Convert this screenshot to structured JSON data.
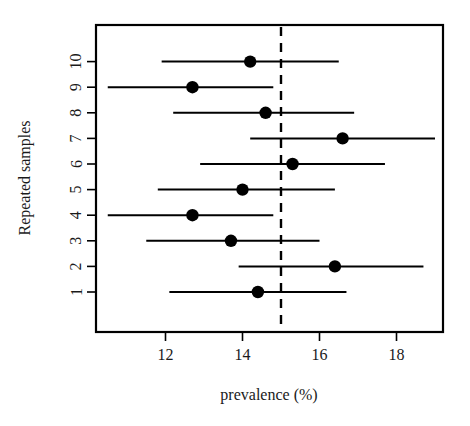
{
  "chart_data": {
    "type": "scatter",
    "title": "",
    "subtitle": "",
    "xlabel": "prevalence (%)",
    "ylabel": "Repeated samples",
    "xlim": [
      10.1,
      19.2
    ],
    "ylim": [
      0.4,
      10.6
    ],
    "grid": false,
    "legend": null,
    "xticks": [
      12,
      14,
      16,
      18
    ],
    "xtick_labels": [
      "12",
      "14",
      "16",
      "18"
    ],
    "yticks": [
      1,
      2,
      3,
      4,
      5,
      6,
      7,
      8,
      9,
      10
    ],
    "ytick_labels": [
      "1",
      "2",
      "3",
      "4",
      "5",
      "6",
      "7",
      "8",
      "9",
      "10"
    ],
    "annotations": [
      {
        "name": "reference-line",
        "type": "vline",
        "x": 15.0,
        "style": "dashed",
        "label": ""
      }
    ],
    "series": [
      {
        "name": "prevalence estimate with 95% confidence interval",
        "marker": "filled-circle",
        "color": "#000000",
        "points": [
          {
            "sample": 1,
            "estimate": 14.4,
            "ci_low": 12.1,
            "ci_high": 16.7
          },
          {
            "sample": 2,
            "estimate": 16.4,
            "ci_low": 13.9,
            "ci_high": 18.7
          },
          {
            "sample": 3,
            "estimate": 13.7,
            "ci_low": 11.5,
            "ci_high": 16.0
          },
          {
            "sample": 4,
            "estimate": 12.7,
            "ci_low": 10.5,
            "ci_high": 14.8
          },
          {
            "sample": 5,
            "estimate": 14.0,
            "ci_low": 11.8,
            "ci_high": 16.4
          },
          {
            "sample": 6,
            "estimate": 15.3,
            "ci_low": 12.9,
            "ci_high": 17.7
          },
          {
            "sample": 7,
            "estimate": 16.6,
            "ci_low": 14.2,
            "ci_high": 19.0
          },
          {
            "sample": 8,
            "estimate": 14.6,
            "ci_low": 12.2,
            "ci_high": 16.9
          },
          {
            "sample": 9,
            "estimate": 12.7,
            "ci_low": 10.5,
            "ci_high": 14.8
          },
          {
            "sample": 10,
            "estimate": 14.2,
            "ci_low": 11.9,
            "ci_high": 16.5
          }
        ]
      }
    ]
  },
  "axes": {
    "x_title": "prevalence (%)",
    "y_title": "Repeated samples"
  }
}
